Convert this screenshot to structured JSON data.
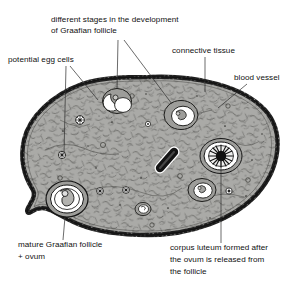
{
  "figure": {
    "colors": {
      "stroma_fill": "#a9a9a6",
      "cortex_outline": "#1a1a1a",
      "follicle_fluid": "#ffffff",
      "corpus_luteum_core": "#141414",
      "blood_vessel": "#151515",
      "label_text": "#101010",
      "leader_line": "#2b2b2b",
      "background": "#ffffff"
    },
    "labels": {
      "development_stages": {
        "line1": "different stages in the development",
        "line2": "of Graafian  follicle"
      },
      "potential_egg_cells": {
        "line1": "potential egg cells"
      },
      "connective_tissue": {
        "line1": "connective tissue"
      },
      "blood_vessel": {
        "line1": "blood vessel"
      },
      "mature_follicle": {
        "line1": "mature Graafian follicle",
        "line2": "+ ovum"
      },
      "corpus_luteum": {
        "line1": "corpus luteum formed after",
        "line2": "the ovum is released from",
        "line3": "the follicle"
      }
    }
  }
}
